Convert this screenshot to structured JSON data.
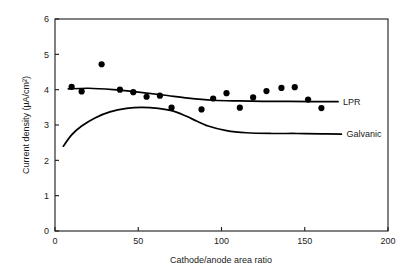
{
  "chart_data": {
    "type": "scatter",
    "title": "",
    "xlabel": "Cathode/anode area ratio",
    "ylabel": "Current density (µA/cm²)",
    "xlim": [
      0,
      200
    ],
    "ylim": [
      0,
      6
    ],
    "xticks": [
      0,
      50,
      100,
      150,
      200
    ],
    "yticks": [
      0,
      1,
      2,
      3,
      4,
      5,
      6
    ],
    "xtick_labels": [
      "0",
      "50",
      "100",
      "150",
      "200"
    ],
    "ytick_labels": [
      "0",
      "1",
      "2",
      "3",
      "4",
      "5",
      "6"
    ],
    "grid": false,
    "legend_position": "right-inline",
    "series": [
      {
        "name": "LPR",
        "label": "LPR",
        "type": "scatter+line",
        "marker": "filled-circle",
        "color": "#000000",
        "points": [
          {
            "x": 10,
            "y": 4.08
          },
          {
            "x": 16,
            "y": 3.95
          },
          {
            "x": 28,
            "y": 4.72
          },
          {
            "x": 39,
            "y": 4.0
          },
          {
            "x": 47,
            "y": 3.93
          },
          {
            "x": 55,
            "y": 3.8
          },
          {
            "x": 63,
            "y": 3.83
          },
          {
            "x": 70,
            "y": 3.49
          },
          {
            "x": 88,
            "y": 3.44
          },
          {
            "x": 95,
            "y": 3.75
          },
          {
            "x": 103,
            "y": 3.9
          },
          {
            "x": 111,
            "y": 3.49
          },
          {
            "x": 119,
            "y": 3.78
          },
          {
            "x": 127,
            "y": 3.96
          },
          {
            "x": 136,
            "y": 4.05
          },
          {
            "x": 144,
            "y": 4.07
          },
          {
            "x": 152,
            "y": 3.72
          },
          {
            "x": 160,
            "y": 3.48
          }
        ],
        "fit_curve": [
          {
            "x": 8,
            "y": 4.02
          },
          {
            "x": 20,
            "y": 4.04
          },
          {
            "x": 35,
            "y": 4.0
          },
          {
            "x": 50,
            "y": 3.93
          },
          {
            "x": 65,
            "y": 3.85
          },
          {
            "x": 80,
            "y": 3.76
          },
          {
            "x": 95,
            "y": 3.7
          },
          {
            "x": 110,
            "y": 3.68
          },
          {
            "x": 125,
            "y": 3.67
          },
          {
            "x": 140,
            "y": 3.67
          },
          {
            "x": 155,
            "y": 3.66
          },
          {
            "x": 170,
            "y": 3.66
          }
        ]
      },
      {
        "name": "Galvanic",
        "label": "Galvanic",
        "type": "line",
        "color": "#000000",
        "fit_curve": [
          {
            "x": 5,
            "y": 2.4
          },
          {
            "x": 10,
            "y": 2.72
          },
          {
            "x": 16,
            "y": 2.97
          },
          {
            "x": 24,
            "y": 3.2
          },
          {
            "x": 33,
            "y": 3.37
          },
          {
            "x": 43,
            "y": 3.47
          },
          {
            "x": 52,
            "y": 3.5
          },
          {
            "x": 62,
            "y": 3.47
          },
          {
            "x": 72,
            "y": 3.38
          },
          {
            "x": 82,
            "y": 3.18
          },
          {
            "x": 92,
            "y": 2.97
          },
          {
            "x": 103,
            "y": 2.84
          },
          {
            "x": 115,
            "y": 2.78
          },
          {
            "x": 130,
            "y": 2.76
          },
          {
            "x": 145,
            "y": 2.76
          },
          {
            "x": 160,
            "y": 2.75
          },
          {
            "x": 172,
            "y": 2.74
          }
        ]
      }
    ]
  }
}
